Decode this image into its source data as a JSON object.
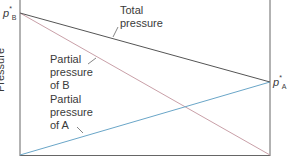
{
  "diagram": {
    "y_axis_label": "Pressure",
    "endpoint_labels": {
      "left_top": {
        "symbol": "p",
        "superscript": "*",
        "subscript": "B"
      },
      "right_mid": {
        "symbol": "p",
        "superscript": "*",
        "subscript": "A"
      }
    },
    "curves": [
      {
        "name": "Total pressure",
        "label_lines": [
          "Total",
          "pressure"
        ],
        "color": "#555555",
        "from": [
          20,
          13
        ],
        "to": [
          270,
          82
        ]
      },
      {
        "name": "Partial pressure of B",
        "label_lines": [
          "Partial",
          "pressure",
          "of B"
        ],
        "color": "#c9a0a8",
        "from": [
          20,
          13
        ],
        "to": [
          270,
          155
        ]
      },
      {
        "name": "Partial pressure of A",
        "label_lines": [
          "Partial",
          "pressure",
          "of A"
        ],
        "color": "#6aa6c8",
        "from": [
          20,
          155
        ],
        "to": [
          270,
          82
        ]
      }
    ],
    "axis_color": "#555555"
  }
}
